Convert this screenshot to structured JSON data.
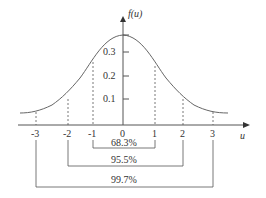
{
  "diagram": {
    "y_axis_label": "f(u)",
    "x_axis_label": "u",
    "y_ticks": [
      "0.1",
      "0.2",
      "0.3"
    ],
    "x_ticks": [
      "-3",
      "-2",
      "-1",
      "0",
      "1",
      "2",
      "3"
    ],
    "intervals": [
      {
        "range": "-1 to 1",
        "label": "68.3%"
      },
      {
        "range": "-2 to 2",
        "label": "95.5%"
      },
      {
        "range": "-3 to 3",
        "label": "99.7%"
      }
    ],
    "colors": {
      "line": "#555555",
      "text": "#333333"
    }
  }
}
